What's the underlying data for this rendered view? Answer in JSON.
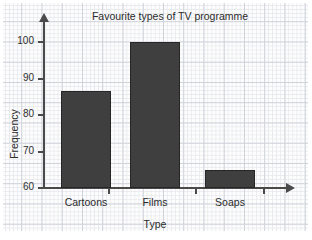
{
  "chart_data": {
    "type": "bar",
    "title": "Favourite types of TV programme",
    "xlabel": "Type",
    "ylabel": "Frequency",
    "categories": [
      "Cartoons",
      "Films",
      "Soaps"
    ],
    "values": [
      86.5,
      100,
      65
    ],
    "ylim": [
      60,
      100
    ],
    "yticks": [
      60,
      70,
      80,
      90,
      100
    ],
    "ytick_labels": [
      "60",
      "70",
      "80",
      "90",
      "100"
    ],
    "grid": true,
    "grid_style": "graph-paper",
    "legend": null,
    "bar_color": "#3f3f3f",
    "bar_edge_color": "#262626",
    "axis_color": "#4a4a4a",
    "background": "#fdfdfd",
    "grid_minor_color": "#e9eaee",
    "grid_major_color": "#cfd2da"
  }
}
